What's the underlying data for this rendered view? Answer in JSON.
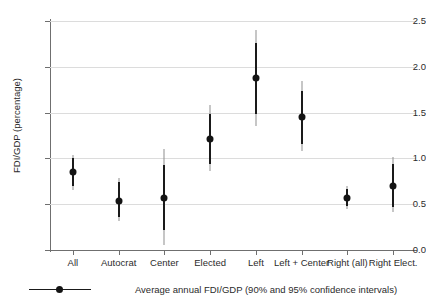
{
  "chart_data": {
    "type": "scatter",
    "title": "",
    "xlabel": "",
    "ylabel": "FDI/GDP (percentage)",
    "ylim": [
      0.0,
      2.5
    ],
    "yticks": [
      "0.0",
      "0.5",
      "1.0",
      "1.5",
      "2.0",
      "2.5"
    ],
    "ytick_values": [
      0.0,
      0.5,
      1.0,
      1.5,
      2.0,
      2.5
    ],
    "grid": true,
    "legend_position": "bottom",
    "legend": [
      "Average annual FDI/GDP (90% and 95% confidence intervals)"
    ],
    "categories": [
      "All",
      "Autocrat",
      "Center",
      "Elected",
      "Left",
      "Left + Center",
      "Right (all)",
      "Right Elect."
    ],
    "values": [
      0.85,
      0.54,
      0.57,
      1.21,
      1.88,
      1.45,
      0.57,
      0.7
    ],
    "ci90_low": [
      0.7,
      0.36,
      0.22,
      0.94,
      1.48,
      1.16,
      0.48,
      0.47
    ],
    "ci90_high": [
      1.0,
      0.74,
      0.93,
      1.48,
      2.26,
      1.74,
      0.67,
      0.94
    ],
    "ci95_low": [
      0.66,
      0.32,
      0.05,
      0.86,
      1.35,
      1.08,
      0.45,
      0.41
    ],
    "ci95_high": [
      1.04,
      0.79,
      1.1,
      1.58,
      2.4,
      1.84,
      0.7,
      1.02
    ],
    "marker_color": "#141414",
    "ci90_color": "#1a1a1a",
    "ci95_color": "#8e8e8e",
    "grid_color": "#dcdcdc",
    "axis_color": "#6f6f6f"
  }
}
